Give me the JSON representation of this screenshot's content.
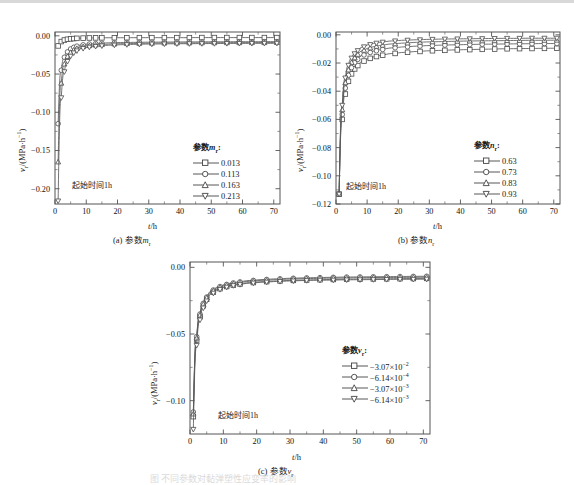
{
  "figure": {
    "caption": "图  不同参数对黏弹塑性应变率的影响",
    "panels": [
      {
        "id": "a",
        "caption_prefix": "(a)",
        "caption_param": "参数mr"
      },
      {
        "id": "b",
        "caption_prefix": "(b)",
        "caption_param": "参数nr"
      },
      {
        "id": "c",
        "caption_prefix": "(c)",
        "caption_param": "参数vr"
      }
    ]
  },
  "axes": {
    "xlabel": "t/h",
    "ylabel": "vr/(MPa·h−1)",
    "annotation": "起始时间1h"
  },
  "chart_data": [
    {
      "type": "line",
      "panel": "a",
      "title": "(a) 参数mr",
      "xlabel": "t/h",
      "ylabel": "vr/(MPa·h−1)",
      "xlim": [
        0,
        72
      ],
      "ylim": [
        -0.22,
        0.005
      ],
      "xticks": [
        0,
        10,
        20,
        30,
        40,
        50,
        60,
        70
      ],
      "yticks": [
        0.0,
        -0.05,
        -0.1,
        -0.15,
        -0.2
      ],
      "ytick_labels": [
        "0.00",
        "−0.05",
        "−0.10",
        "−0.15",
        "−0.20"
      ],
      "grid": false,
      "legend_title": "参数 mr :",
      "legend_position": "center-right",
      "x": [
        1,
        2,
        3,
        4,
        5,
        6,
        7,
        9,
        11,
        13,
        15,
        19,
        23,
        27,
        31,
        35,
        39,
        43,
        47,
        51,
        55,
        59,
        63,
        67,
        71
      ],
      "series": [
        {
          "name": "0.013",
          "marker": "square",
          "values": [
            -0.0132,
            -0.0075,
            -0.0055,
            -0.0045,
            -0.004,
            -0.0036,
            -0.0033,
            -0.003,
            -0.0028,
            -0.0027,
            -0.0026,
            -0.0025,
            -0.0025,
            -0.0024,
            -0.0024,
            -0.0024,
            -0.0024,
            -0.0024,
            -0.0023,
            -0.0023,
            -0.0023,
            -0.0023,
            -0.0023,
            -0.0023,
            -0.0023
          ]
        },
        {
          "name": "0.113",
          "marker": "circle",
          "values": [
            -0.115,
            -0.045,
            -0.028,
            -0.021,
            -0.0172,
            -0.015,
            -0.0135,
            -0.0118,
            -0.0108,
            -0.0102,
            -0.0097,
            -0.0091,
            -0.0087,
            -0.0085,
            -0.0083,
            -0.0082,
            -0.0081,
            -0.008,
            -0.0079,
            -0.0078,
            -0.0078,
            -0.0077,
            -0.0077,
            -0.0077,
            -0.0076
          ]
        },
        {
          "name": "0.163",
          "marker": "triangle",
          "values": [
            -0.165,
            -0.062,
            -0.037,
            -0.027,
            -0.0218,
            -0.0186,
            -0.0166,
            -0.0142,
            -0.0129,
            -0.0121,
            -0.0115,
            -0.0107,
            -0.0102,
            -0.0099,
            -0.0097,
            -0.0095,
            -0.0094,
            -0.0093,
            -0.0092,
            -0.0091,
            -0.009,
            -0.009,
            -0.0089,
            -0.0089,
            -0.0088
          ]
        },
        {
          "name": "0.213",
          "marker": "dtriangle",
          "values": [
            -0.216,
            -0.081,
            -0.047,
            -0.0335,
            -0.0265,
            -0.0223,
            -0.0196,
            -0.0165,
            -0.0148,
            -0.0138,
            -0.0131,
            -0.0121,
            -0.0115,
            -0.0111,
            -0.0108,
            -0.0106,
            -0.0104,
            -0.0103,
            -0.0102,
            -0.0101,
            -0.01,
            -0.0099,
            -0.0099,
            -0.0098,
            -0.0098
          ]
        }
      ]
    },
    {
      "type": "line",
      "panel": "b",
      "title": "(b) 参数nr",
      "xlabel": "t/h",
      "ylabel": "vr/(MPa·h−1)",
      "xlim": [
        0,
        72
      ],
      "ylim": [
        -0.12,
        0.002
      ],
      "xticks": [
        0,
        10,
        20,
        30,
        40,
        50,
        60,
        70
      ],
      "yticks": [
        0.0,
        -0.02,
        -0.04,
        -0.06,
        -0.08,
        -0.1,
        -0.12
      ],
      "ytick_labels": [
        "0.00",
        "−0.02",
        "−0.04",
        "−0.06",
        "−0.08",
        "−0.10",
        "−0.12"
      ],
      "grid": false,
      "legend_title": "参数 nr :",
      "legend_position": "center-right",
      "x": [
        1,
        2,
        3,
        4,
        5,
        6,
        7,
        9,
        11,
        13,
        15,
        19,
        23,
        27,
        31,
        35,
        39,
        43,
        47,
        51,
        55,
        59,
        63,
        67,
        71
      ],
      "series": [
        {
          "name": "0.63",
          "marker": "square",
          "values": [
            -0.113,
            -0.06,
            -0.042,
            -0.033,
            -0.0277,
            -0.0242,
            -0.0218,
            -0.0186,
            -0.0167,
            -0.0154,
            -0.0145,
            -0.0132,
            -0.0124,
            -0.0118,
            -0.0113,
            -0.011,
            -0.0107,
            -0.0105,
            -0.0103,
            -0.0101,
            -0.0099,
            -0.0098,
            -0.0097,
            -0.0096,
            -0.0095
          ]
        },
        {
          "name": "0.73",
          "marker": "circle",
          "values": [
            -0.113,
            -0.0565,
            -0.0378,
            -0.0287,
            -0.0233,
            -0.0198,
            -0.0174,
            -0.0143,
            -0.0125,
            -0.0113,
            -0.0104,
            -0.0092,
            -0.0085,
            -0.008,
            -0.0076,
            -0.0073,
            -0.0071,
            -0.0069,
            -0.0067,
            -0.0066,
            -0.0065,
            -0.0064,
            -0.0063,
            -0.0062,
            -0.0062
          ]
        },
        {
          "name": "0.83",
          "marker": "triangle",
          "values": [
            -0.113,
            -0.0532,
            -0.034,
            -0.0249,
            -0.0196,
            -0.0163,
            -0.0139,
            -0.011,
            -0.0093,
            -0.0082,
            -0.0074,
            -0.0064,
            -0.0058,
            -0.0053,
            -0.005,
            -0.0048,
            -0.0046,
            -0.0044,
            -0.0043,
            -0.0042,
            -0.0041,
            -0.004,
            -0.0039,
            -0.0039,
            -0.0038
          ]
        },
        {
          "name": "0.93",
          "marker": "dtriangle",
          "values": [
            -0.113,
            -0.05,
            -0.0306,
            -0.0216,
            -0.0165,
            -0.0134,
            -0.0112,
            -0.0085,
            -0.0069,
            -0.0059,
            -0.0052,
            -0.0043,
            -0.0038,
            -0.0035,
            -0.0032,
            -0.003,
            -0.0029,
            -0.0028,
            -0.0027,
            -0.0026,
            -0.0025,
            -0.0025,
            -0.0024,
            -0.0024,
            -0.0024
          ]
        }
      ]
    },
    {
      "type": "line",
      "panel": "c",
      "title": "(c) 参数vr",
      "xlabel": "t/h",
      "ylabel": "vr/(MPa·h−1)",
      "xlim": [
        0,
        72
      ],
      "ylim": [
        -0.125,
        0.004
      ],
      "xticks": [
        0,
        10,
        20,
        30,
        40,
        50,
        60,
        70
      ],
      "yticks": [
        0.0,
        -0.05,
        -0.1
      ],
      "ytick_labels": [
        "0.00",
        "−0.05",
        "−0.10"
      ],
      "grid": false,
      "legend_title": "参数 vr :",
      "legend_position": "center-right",
      "x": [
        1,
        2,
        3,
        4,
        5,
        7,
        9,
        11,
        13,
        15,
        19,
        23,
        27,
        31,
        35,
        39,
        43,
        47,
        51,
        55,
        59,
        63,
        67,
        71
      ],
      "series": [
        {
          "name": "−3.07×10−2",
          "marker": "square",
          "values": [
            -0.112,
            -0.0545,
            -0.037,
            -0.0288,
            -0.024,
            -0.0186,
            -0.016,
            -0.0144,
            -0.0133,
            -0.0125,
            -0.0114,
            -0.0107,
            -0.0102,
            -0.0098,
            -0.0095,
            -0.0093,
            -0.0091,
            -0.0089,
            -0.0088,
            -0.0087,
            -0.0086,
            -0.0085,
            -0.0084,
            -0.0083
          ]
        },
        {
          "name": "−6.14×10−4",
          "marker": "circle",
          "values": [
            -0.1085,
            -0.052,
            -0.035,
            -0.027,
            -0.0223,
            -0.017,
            -0.0144,
            -0.0128,
            -0.0117,
            -0.0109,
            -0.0098,
            -0.0091,
            -0.0086,
            -0.0082,
            -0.0079,
            -0.0077,
            -0.0075,
            -0.0073,
            -0.0072,
            -0.0071,
            -0.007,
            -0.0069,
            -0.0068,
            -0.0067
          ]
        },
        {
          "name": "−3.07×10−3",
          "marker": "triangle",
          "values": [
            -0.11,
            -0.053,
            -0.0358,
            -0.0277,
            -0.0229,
            -0.0176,
            -0.015,
            -0.0134,
            -0.0123,
            -0.0115,
            -0.0104,
            -0.0097,
            -0.0092,
            -0.0088,
            -0.0085,
            -0.0083,
            -0.0081,
            -0.008,
            -0.0078,
            -0.0077,
            -0.0076,
            -0.0076,
            -0.0075,
            -0.0074
          ]
        },
        {
          "name": "−6.14×10−3",
          "marker": "dtriangle",
          "values": [
            -0.1215,
            -0.0585,
            -0.0395,
            -0.0305,
            -0.0252,
            -0.0194,
            -0.0166,
            -0.0149,
            -0.0137,
            -0.0129,
            -0.0118,
            -0.0111,
            -0.0106,
            -0.0102,
            -0.0099,
            -0.0097,
            -0.0096,
            -0.0094,
            -0.0093,
            -0.0092,
            -0.0091,
            -0.009,
            -0.009,
            -0.0089
          ]
        }
      ]
    }
  ],
  "legends": {
    "a": {
      "title_cn": "参数",
      "title_sym": "m",
      "title_sub": "r",
      "title_colon": ":",
      "items": [
        "0.013",
        "0.113",
        "0.163",
        "0.213"
      ]
    },
    "b": {
      "title_cn": "参数",
      "title_sym": "n",
      "title_sub": "r",
      "title_colon": ":",
      "items": [
        "0.63",
        "0.73",
        "0.83",
        "0.93"
      ]
    },
    "c": {
      "title_cn": "参数",
      "title_sym": "v",
      "title_sub": "r",
      "title_colon": ":",
      "items": [
        "−3.07×10",
        "−6.14×10",
        "−3.07×10",
        "−6.14×10"
      ],
      "exponents": [
        "−2",
        "−4",
        "−3",
        "−3"
      ]
    }
  },
  "captions": {
    "a_prefix": "(a)",
    "a_text": "参数",
    "a_sym": "m",
    "a_sub": "r",
    "b_prefix": "(b)",
    "b_text": "参数",
    "b_sym": "n",
    "b_sub": "r",
    "c_prefix": "(c)",
    "c_text": "参数",
    "c_sym": "v",
    "c_sub": "r"
  },
  "ylabel_parts": {
    "sym": "v",
    "sub": "r",
    "rest": "/(MPa·h",
    "sup": "−1",
    "close": ")"
  },
  "xlabel_parts": {
    "sym": "t",
    "rest": "/h"
  }
}
